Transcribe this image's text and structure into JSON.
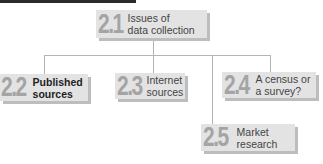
{
  "diagram": {
    "root": {
      "number": "2.1",
      "label": "Issues of\ndata collection"
    },
    "children": [
      {
        "number": "2.2",
        "label": "Published\nsources",
        "emphasized": true
      },
      {
        "number": "2.3",
        "label": "Internet\nsources",
        "emphasized": false
      },
      {
        "number": "2.4",
        "label": "A census or\na survey?",
        "emphasized": false
      },
      {
        "number": "2.5",
        "label": "Market\nresearch",
        "emphasized": false
      }
    ],
    "colors": {
      "box": "#e3e3e3",
      "shadow": "#bdbdbd",
      "number": "#a4a4a4",
      "connector": "#b4b4b4",
      "top_bar": "#2b2b2b"
    }
  }
}
